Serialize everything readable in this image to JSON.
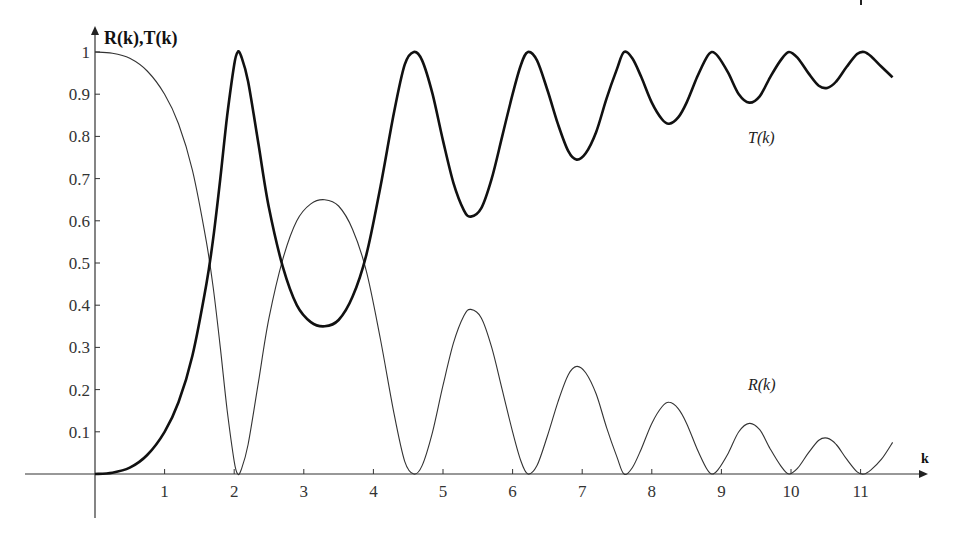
{
  "chart_data": {
    "type": "line",
    "title": "",
    "xlabel": "k",
    "ylabel": "R(k),T(k)",
    "xlim": [
      0,
      11.5
    ],
    "ylim": [
      0,
      1
    ],
    "grid": false,
    "legend": "none (inline curve labels)",
    "x_ticks": [
      "1",
      "2",
      "3",
      "4",
      "5",
      "6",
      "7",
      "8",
      "9",
      "10",
      "11"
    ],
    "y_ticks": [
      "0.1",
      "0.2",
      "0.3",
      "0.4",
      "0.5",
      "0.6",
      "0.7",
      "0.8",
      "0.9",
      "1"
    ],
    "annotations": [
      {
        "text": "T(k)",
        "k": 9.3,
        "value": 0.8
      },
      {
        "text": "R(k)",
        "k": 9.3,
        "value": 0.2
      }
    ],
    "series": [
      {
        "name": "T(k)",
        "style": "thick",
        "points": [
          [
            0,
            0
          ],
          [
            0.25,
            0.003
          ],
          [
            0.5,
            0.015
          ],
          [
            0.75,
            0.045
          ],
          [
            1.0,
            0.1
          ],
          [
            1.2,
            0.17
          ],
          [
            1.4,
            0.28
          ],
          [
            1.6,
            0.45
          ],
          [
            1.7,
            0.56
          ],
          [
            1.8,
            0.7
          ],
          [
            1.9,
            0.85
          ],
          [
            2.0,
            0.97
          ],
          [
            2.05,
            1.0
          ],
          [
            2.1,
            0.99
          ],
          [
            2.2,
            0.93
          ],
          [
            2.35,
            0.78
          ],
          [
            2.5,
            0.63
          ],
          [
            2.7,
            0.49
          ],
          [
            2.9,
            0.4
          ],
          [
            3.1,
            0.36
          ],
          [
            3.3,
            0.35
          ],
          [
            3.5,
            0.365
          ],
          [
            3.7,
            0.42
          ],
          [
            3.9,
            0.52
          ],
          [
            4.1,
            0.68
          ],
          [
            4.3,
            0.86
          ],
          [
            4.45,
            0.97
          ],
          [
            4.58,
            1.0
          ],
          [
            4.7,
            0.98
          ],
          [
            4.85,
            0.9
          ],
          [
            5.0,
            0.79
          ],
          [
            5.15,
            0.69
          ],
          [
            5.3,
            0.625
          ],
          [
            5.4,
            0.61
          ],
          [
            5.55,
            0.63
          ],
          [
            5.7,
            0.7
          ],
          [
            5.85,
            0.8
          ],
          [
            6.0,
            0.9
          ],
          [
            6.12,
            0.97
          ],
          [
            6.22,
            1.0
          ],
          [
            6.35,
            0.98
          ],
          [
            6.5,
            0.91
          ],
          [
            6.65,
            0.83
          ],
          [
            6.8,
            0.765
          ],
          [
            6.92,
            0.745
          ],
          [
            7.05,
            0.76
          ],
          [
            7.2,
            0.81
          ],
          [
            7.35,
            0.89
          ],
          [
            7.5,
            0.96
          ],
          [
            7.6,
            1.0
          ],
          [
            7.72,
            0.985
          ],
          [
            7.85,
            0.94
          ],
          [
            8.0,
            0.88
          ],
          [
            8.15,
            0.84
          ],
          [
            8.25,
            0.83
          ],
          [
            8.38,
            0.845
          ],
          [
            8.5,
            0.88
          ],
          [
            8.65,
            0.94
          ],
          [
            8.78,
            0.985
          ],
          [
            8.86,
            1.0
          ],
          [
            8.95,
            0.99
          ],
          [
            9.1,
            0.95
          ],
          [
            9.25,
            0.9
          ],
          [
            9.4,
            0.88
          ],
          [
            9.55,
            0.895
          ],
          [
            9.7,
            0.94
          ],
          [
            9.85,
            0.98
          ],
          [
            9.97,
            1.0
          ],
          [
            10.1,
            0.985
          ],
          [
            10.25,
            0.95
          ],
          [
            10.4,
            0.92
          ],
          [
            10.52,
            0.915
          ],
          [
            10.65,
            0.93
          ],
          [
            10.8,
            0.965
          ],
          [
            10.95,
            0.995
          ],
          [
            11.05,
            1.0
          ],
          [
            11.15,
            0.99
          ],
          [
            11.3,
            0.965
          ],
          [
            11.46,
            0.94
          ]
        ]
      },
      {
        "name": "R(k)",
        "style": "thin",
        "points": [
          [
            0,
            1
          ],
          [
            0.25,
            0.997
          ],
          [
            0.5,
            0.985
          ],
          [
            0.75,
            0.955
          ],
          [
            1.0,
            0.9
          ],
          [
            1.2,
            0.83
          ],
          [
            1.4,
            0.72
          ],
          [
            1.6,
            0.55
          ],
          [
            1.7,
            0.44
          ],
          [
            1.8,
            0.3
          ],
          [
            1.9,
            0.15
          ],
          [
            2.0,
            0.03
          ],
          [
            2.05,
            0.0
          ],
          [
            2.1,
            0.01
          ],
          [
            2.2,
            0.07
          ],
          [
            2.35,
            0.22
          ],
          [
            2.5,
            0.37
          ],
          [
            2.7,
            0.51
          ],
          [
            2.9,
            0.6
          ],
          [
            3.1,
            0.64
          ],
          [
            3.3,
            0.65
          ],
          [
            3.5,
            0.635
          ],
          [
            3.7,
            0.58
          ],
          [
            3.9,
            0.48
          ],
          [
            4.1,
            0.32
          ],
          [
            4.3,
            0.14
          ],
          [
            4.45,
            0.03
          ],
          [
            4.58,
            0.0
          ],
          [
            4.7,
            0.02
          ],
          [
            4.85,
            0.1
          ],
          [
            5.0,
            0.21
          ],
          [
            5.15,
            0.31
          ],
          [
            5.3,
            0.375
          ],
          [
            5.4,
            0.39
          ],
          [
            5.55,
            0.37
          ],
          [
            5.7,
            0.3
          ],
          [
            5.85,
            0.2
          ],
          [
            6.0,
            0.1
          ],
          [
            6.12,
            0.03
          ],
          [
            6.22,
            0.0
          ],
          [
            6.35,
            0.02
          ],
          [
            6.5,
            0.09
          ],
          [
            6.65,
            0.17
          ],
          [
            6.8,
            0.235
          ],
          [
            6.92,
            0.255
          ],
          [
            7.05,
            0.24
          ],
          [
            7.2,
            0.19
          ],
          [
            7.35,
            0.11
          ],
          [
            7.5,
            0.04
          ],
          [
            7.6,
            0.0
          ],
          [
            7.72,
            0.015
          ],
          [
            7.85,
            0.06
          ],
          [
            8.0,
            0.12
          ],
          [
            8.15,
            0.16
          ],
          [
            8.25,
            0.17
          ],
          [
            8.38,
            0.155
          ],
          [
            8.5,
            0.12
          ],
          [
            8.65,
            0.06
          ],
          [
            8.78,
            0.015
          ],
          [
            8.86,
            0.0
          ],
          [
            8.95,
            0.01
          ],
          [
            9.1,
            0.05
          ],
          [
            9.25,
            0.1
          ],
          [
            9.4,
            0.12
          ],
          [
            9.55,
            0.105
          ],
          [
            9.7,
            0.06
          ],
          [
            9.85,
            0.02
          ],
          [
            9.97,
            0.0
          ],
          [
            10.1,
            0.015
          ],
          [
            10.25,
            0.05
          ],
          [
            10.4,
            0.08
          ],
          [
            10.52,
            0.085
          ],
          [
            10.65,
            0.07
          ],
          [
            10.8,
            0.035
          ],
          [
            10.95,
            0.005
          ],
          [
            11.05,
            0.0
          ],
          [
            11.15,
            0.01
          ],
          [
            11.3,
            0.035
          ],
          [
            11.46,
            0.075
          ]
        ]
      }
    ]
  },
  "axes": {
    "y_title": "R(k),T(k)",
    "x_title": "k"
  },
  "labels": {
    "t_curve": "T(k)",
    "r_curve": "R(k)"
  }
}
